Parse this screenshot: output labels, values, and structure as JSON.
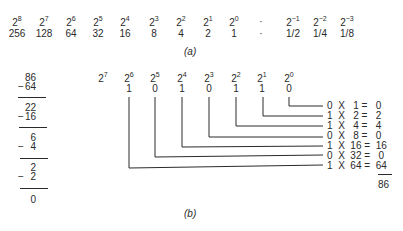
{
  "part_a": {
    "powers": [
      {
        "base": "2",
        "exp": "8",
        "value": "256"
      },
      {
        "base": "2",
        "exp": "7",
        "value": "128"
      },
      {
        "base": "2",
        "exp": "6",
        "value": "64"
      },
      {
        "base": "2",
        "exp": "5",
        "value": "32"
      },
      {
        "base": "2",
        "exp": "4",
        "value": "16"
      },
      {
        "base": "2",
        "exp": "3",
        "value": "8"
      },
      {
        "base": "2",
        "exp": "2",
        "value": "4"
      },
      {
        "base": "2",
        "exp": "1",
        "value": "2"
      },
      {
        "base": "2",
        "exp": "0",
        "value": "1"
      },
      {
        "base": "·",
        "exp": "",
        "value": "·"
      },
      {
        "base": "2",
        "exp": "−1",
        "value": "1/2"
      },
      {
        "base": "2",
        "exp": "−2",
        "value": "1/4"
      },
      {
        "base": "2",
        "exp": "−3",
        "value": "1/8"
      }
    ],
    "caption": "(a)"
  },
  "subtraction": {
    "steps": [
      {
        "top": "86",
        "sub": "64"
      },
      {
        "top": "22",
        "sub": "16"
      },
      {
        "top": "6",
        "sub": "4"
      },
      {
        "top": "2",
        "sub": "2"
      }
    ],
    "minus_sign": "−",
    "result": "0"
  },
  "part_b": {
    "powers": [
      {
        "base": "2",
        "exp": "7",
        "bit": ""
      },
      {
        "base": "2",
        "exp": "6",
        "bit": "1"
      },
      {
        "base": "2",
        "exp": "5",
        "bit": "0"
      },
      {
        "base": "2",
        "exp": "4",
        "bit": "1"
      },
      {
        "base": "2",
        "exp": "3",
        "bit": "0"
      },
      {
        "base": "2",
        "exp": "2",
        "bit": "1"
      },
      {
        "base": "2",
        "exp": "1",
        "bit": "1"
      },
      {
        "base": "2",
        "exp": "0",
        "bit": "0"
      }
    ],
    "products": [
      {
        "bit": "0",
        "times": "X",
        "weight": "1",
        "equals": "=",
        "result": "0"
      },
      {
        "bit": "1",
        "times": "X",
        "weight": "2",
        "equals": "=",
        "result": "2"
      },
      {
        "bit": "1",
        "times": "X",
        "weight": "4",
        "equals": "=",
        "result": "4"
      },
      {
        "bit": "0",
        "times": "X",
        "weight": "8",
        "equals": "=",
        "result": "0"
      },
      {
        "bit": "1",
        "times": "X",
        "weight": "16",
        "equals": "=",
        "result": "16"
      },
      {
        "bit": "0",
        "times": "X",
        "weight": "32",
        "equals": "=",
        "result": "0"
      },
      {
        "bit": "1",
        "times": "X",
        "weight": "64",
        "equals": "=",
        "result": "64"
      }
    ],
    "sum": "86",
    "caption": "(b)"
  },
  "colors": {
    "ink": "#2a2a2a",
    "background": "#ffffff"
  }
}
